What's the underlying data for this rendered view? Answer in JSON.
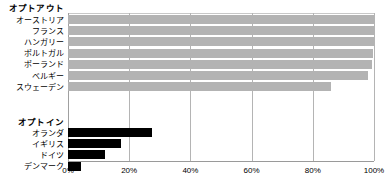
{
  "chart_data": {
    "type": "bar",
    "orientation": "horizontal",
    "title": "",
    "xlabel": "",
    "ylabel": "",
    "xlim": [
      0,
      100
    ],
    "xticks": [
      0,
      20,
      40,
      60,
      80,
      100
    ],
    "xtick_labels": [
      "0%",
      "20%",
      "40%",
      "60%",
      "80%",
      "100%"
    ],
    "grid": true,
    "legend": "none",
    "groups": [
      {
        "name": "optout",
        "label": "オプトアウト",
        "color": "#b3b3b3",
        "categories": [
          "オーストリア",
          "フランス",
          "ハンガリー",
          "ポルトガル",
          "ポーランド",
          "ベルギー",
          "スウェーデン"
        ],
        "values": [
          99.98,
          99.91,
          99.97,
          99.64,
          99.5,
          98.0,
          85.9
        ]
      },
      {
        "name": "optin",
        "label": "オプトイン",
        "color": "#000000",
        "categories": [
          "オランダ",
          "イギリス",
          "ドイツ",
          "デンマーク"
        ],
        "values": [
          27.5,
          17.2,
          12.0,
          4.25
        ]
      }
    ]
  },
  "axis": {
    "ticks": [
      {
        "value": 0,
        "label": "0%"
      },
      {
        "value": 20,
        "label": "20%"
      },
      {
        "value": 40,
        "label": "40%"
      },
      {
        "value": 60,
        "label": "60%"
      },
      {
        "value": 80,
        "label": "80%"
      },
      {
        "value": 100,
        "label": "100%"
      }
    ]
  },
  "colors": {
    "optout_bar": "#b3b3b3",
    "optin_bar": "#000000",
    "gridline": "#b4b4b4",
    "background": "#ffffff"
  }
}
